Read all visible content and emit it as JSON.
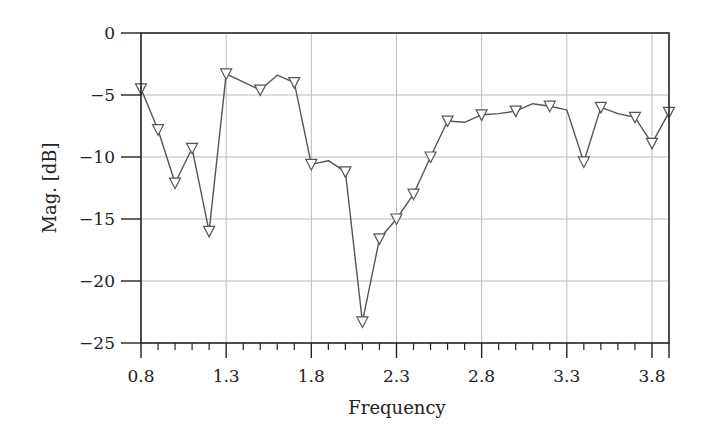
{
  "chart_data": {
    "type": "line",
    "title": "",
    "xlabel": "Frequency",
    "ylabel": "Mag. [dB]",
    "xlim": [
      0.8,
      3.9
    ],
    "ylim": [
      -25,
      0
    ],
    "grid": true,
    "legend": null,
    "x_ticks": [
      0.8,
      1.3,
      1.8,
      2.3,
      2.8,
      3.3,
      3.8
    ],
    "x_tick_labels": [
      "0.8",
      "1.3",
      "1.8",
      "2.3",
      "2.8",
      "3.3",
      "3.8"
    ],
    "x_minor_step": 0.1,
    "y_ticks": [
      0,
      -5,
      -10,
      -15,
      -20,
      -25
    ],
    "y_tick_labels": [
      "0",
      "−5",
      "−10",
      "−15",
      "−20",
      "−25"
    ],
    "series": [
      {
        "name": "Mag",
        "color": "#555555",
        "marker": "triangle-down",
        "points": [
          {
            "x": 0.8,
            "y": -4.5,
            "marker": true
          },
          {
            "x": 0.9,
            "y": -7.8,
            "marker": true
          },
          {
            "x": 1.0,
            "y": -12.1,
            "marker": true
          },
          {
            "x": 1.1,
            "y": -9.3,
            "marker": true
          },
          {
            "x": 1.2,
            "y": -16.0,
            "marker": true
          },
          {
            "x": 1.3,
            "y": -3.3,
            "marker": true
          },
          {
            "x": 1.5,
            "y": -4.6,
            "marker": true
          },
          {
            "x": 1.6,
            "y": -3.4,
            "marker": false
          },
          {
            "x": 1.7,
            "y": -4.0,
            "marker": true
          },
          {
            "x": 1.8,
            "y": -10.6,
            "marker": true
          },
          {
            "x": 1.9,
            "y": -10.3,
            "marker": false
          },
          {
            "x": 2.0,
            "y": -11.2,
            "marker": true
          },
          {
            "x": 2.1,
            "y": -23.3,
            "marker": true
          },
          {
            "x": 2.2,
            "y": -16.6,
            "marker": true
          },
          {
            "x": 2.3,
            "y": -15.0,
            "marker": true
          },
          {
            "x": 2.4,
            "y": -13.0,
            "marker": true
          },
          {
            "x": 2.5,
            "y": -10.0,
            "marker": true
          },
          {
            "x": 2.6,
            "y": -7.1,
            "marker": true
          },
          {
            "x": 2.7,
            "y": -7.2,
            "marker": false
          },
          {
            "x": 2.8,
            "y": -6.6,
            "marker": true
          },
          {
            "x": 2.9,
            "y": -6.5,
            "marker": false
          },
          {
            "x": 3.0,
            "y": -6.3,
            "marker": true
          },
          {
            "x": 3.1,
            "y": -5.7,
            "marker": false
          },
          {
            "x": 3.2,
            "y": -5.9,
            "marker": true
          },
          {
            "x": 3.3,
            "y": -6.2,
            "marker": false
          },
          {
            "x": 3.4,
            "y": -10.4,
            "marker": true
          },
          {
            "x": 3.5,
            "y": -6.0,
            "marker": true
          },
          {
            "x": 3.6,
            "y": -6.5,
            "marker": false
          },
          {
            "x": 3.7,
            "y": -6.8,
            "marker": true
          },
          {
            "x": 3.8,
            "y": -8.9,
            "marker": true
          },
          {
            "x": 3.9,
            "y": -6.4,
            "marker": true
          }
        ]
      }
    ]
  },
  "colors": {
    "axis": "#222222",
    "grid": "#bbbbbb",
    "line": "#555555",
    "marker_stroke": "#555555",
    "marker_fill": "#ffffff"
  }
}
